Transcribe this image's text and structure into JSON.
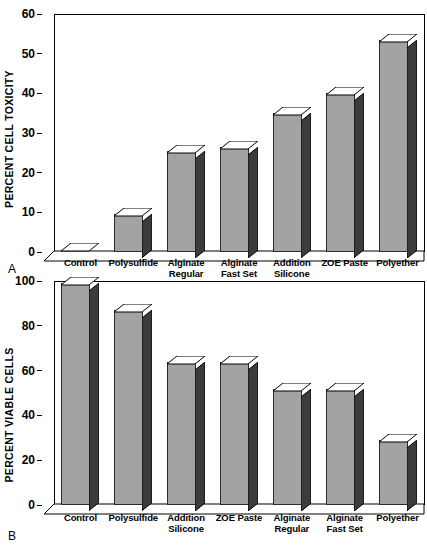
{
  "figure": {
    "panels": [
      {
        "letter": "A",
        "ylabel": "PERCENT CELL TOXICITY",
        "yticks": [
          "0",
          "10",
          "20",
          "30",
          "40",
          "50",
          "60"
        ]
      },
      {
        "letter": "B",
        "ylabel": "PERCENT VIABLE CELLS",
        "yticks": [
          "0",
          "20",
          "40",
          "60",
          "80",
          "100"
        ]
      }
    ]
  },
  "chart_data": [
    {
      "type": "bar",
      "panel": "A",
      "title": "",
      "xlabel": "",
      "ylabel": "PERCENT CELL TOXICITY",
      "ylim": [
        0,
        60
      ],
      "ytick_step": 10,
      "grid": false,
      "legend": "none",
      "style": "3d-column",
      "categories": [
        "Control",
        "Polysulfide",
        "Alginate Regular",
        "Alginate Fast Set",
        "Addition Silicone",
        "ZOE Paste",
        "Polyether"
      ],
      "category_lines": [
        [
          "Control"
        ],
        [
          "Polysulfide"
        ],
        [
          "Alginate",
          "Regular"
        ],
        [
          "Alginate",
          "Fast Set"
        ],
        [
          "Addition",
          "Silicone"
        ],
        [
          "ZOE Paste"
        ],
        [
          "Polyether"
        ]
      ],
      "values": [
        0,
        9,
        25,
        26,
        34.5,
        39.5,
        53
      ]
    },
    {
      "type": "bar",
      "panel": "B",
      "title": "",
      "xlabel": "",
      "ylabel": "PERCENT VIABLE CELLS",
      "ylim": [
        0,
        100
      ],
      "ytick_step": 20,
      "grid": false,
      "legend": "none",
      "style": "3d-column",
      "categories": [
        "Control",
        "Polysulfide",
        "Addition Silicone",
        "ZOE Paste",
        "Alginate Regular",
        "Alginate Fast Set",
        "Polyether"
      ],
      "category_lines": [
        [
          "Control"
        ],
        [
          "Polysulfide"
        ],
        [
          "Addition",
          "Silicone"
        ],
        [
          "ZOE Paste"
        ],
        [
          "Alginate",
          "Regular"
        ],
        [
          "Alginate",
          "Fast Set"
        ],
        [
          "Polyether"
        ]
      ],
      "values": [
        98,
        86,
        63,
        63,
        51,
        51,
        28
      ]
    }
  ],
  "colors": {
    "bar_front": "#a3a3a3",
    "bar_side": "#3c3c3c",
    "bar_top": "#ffffff",
    "outline": "#000000",
    "background": "#ffffff"
  }
}
